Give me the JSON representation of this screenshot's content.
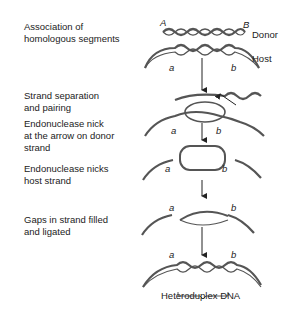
{
  "steps": [
    {
      "label": "Association of\nhomologous segments"
    },
    {
      "label": "Strand separation\nand pairing"
    },
    {
      "label": "Endonuclease nick\nat the arrow on donor\nstrand"
    },
    {
      "label": "Endonuclease nicks\nhost strand"
    },
    {
      "label": "Gaps in strand filled\nand ligated"
    }
  ],
  "markers": {
    "donor_left": "A",
    "donor_right": "B",
    "host_left": "a",
    "host_right": "b"
  },
  "molecules": {
    "donor": "Donor",
    "host": "Host"
  },
  "result_label": "Heteroduplex DNA",
  "colors": {
    "dna": "#555555",
    "text": "#222222"
  }
}
